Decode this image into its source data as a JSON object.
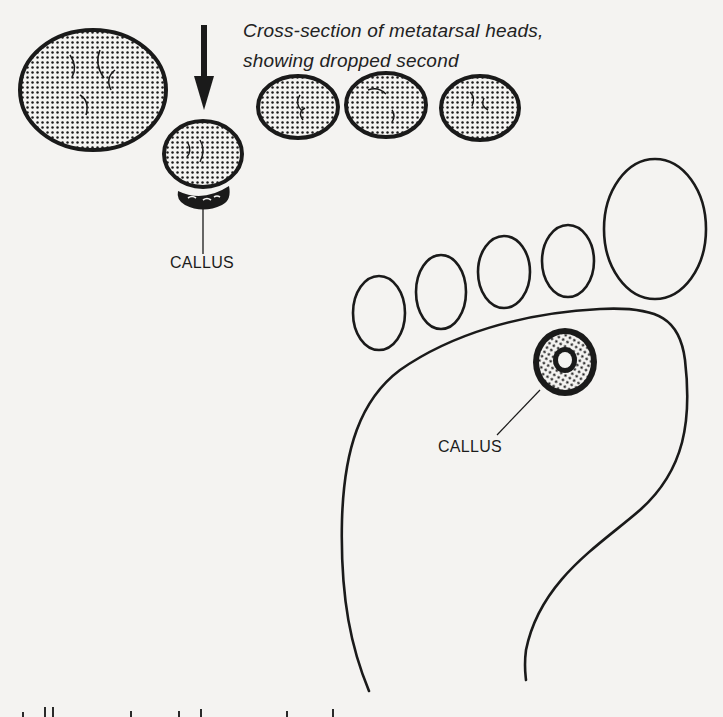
{
  "figure": {
    "caption_line1": "Cross-section of metatarsal heads,",
    "caption_line2": "showing dropped second",
    "labels": {
      "callus_cross_section": "CALLUS",
      "callus_foot_sole": "CALLUS"
    },
    "colors": {
      "paper": "#f4f3f1",
      "ink": "#1a1a1a"
    },
    "elements": {
      "metatarsal_heads": [
        "first (large)",
        "second (dropped)",
        "third",
        "fourth",
        "fifth"
      ],
      "toes": [
        "fifth toe",
        "fourth toe",
        "third toe",
        "second toe",
        "big toe"
      ]
    }
  }
}
